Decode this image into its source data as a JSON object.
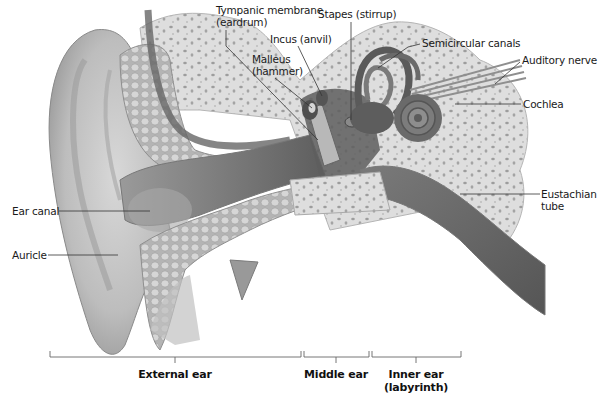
{
  "diagram": {
    "colors": {
      "background": "#ffffff",
      "bone": "#dcdcdc",
      "bone_pores": "#9a9a9a",
      "tissue_light": "#c8c8c8",
      "tissue_mid": "#a9a9a9",
      "tissue_dark": "#6e6e6e",
      "canal_dark": "#5a5a5a",
      "leader_line": "#333333",
      "text": "#1a1a1a"
    },
    "labels": [
      {
        "id": "tympanic-membrane",
        "lines": [
          "Tympanic membrane",
          "(eardrum)"
        ],
        "x": 216,
        "y": 4,
        "pointer": [
          [
            226,
            30
          ],
          [
            226,
            46
          ],
          [
            318,
            140
          ]
        ]
      },
      {
        "id": "stapes",
        "lines": [
          "Stapes (stirrup)"
        ],
        "x": 318,
        "y": 8,
        "pointer": [
          [
            351,
            22
          ],
          [
            351,
            120
          ]
        ]
      },
      {
        "id": "incus",
        "lines": [
          "Incus (anvil)"
        ],
        "x": 270,
        "y": 33,
        "pointer": [
          [
            298,
            46
          ],
          [
            322,
            96
          ]
        ]
      },
      {
        "id": "malleus",
        "lines": [
          "Malleus",
          "(hammer)"
        ],
        "x": 252,
        "y": 53,
        "pointer": [
          [
            275,
            78
          ],
          [
            312,
            108
          ]
        ]
      },
      {
        "id": "semicircular-canals",
        "lines": [
          "Semicircular canals"
        ],
        "x": 422,
        "y": 37,
        "pointer": [
          [
            420,
            44
          ],
          [
            408,
            47
          ],
          [
            378,
            68
          ]
        ]
      },
      {
        "id": "auditory-nerve",
        "lines": [
          "Auditory nerve"
        ],
        "x": 522,
        "y": 54,
        "pointer": [
          [
            520,
            62
          ],
          [
            495,
            84
          ]
        ]
      },
      {
        "id": "cochlea",
        "lines": [
          "Cochlea"
        ],
        "x": 523,
        "y": 98,
        "pointer": [
          [
            521,
            104
          ],
          [
            455,
            104
          ]
        ]
      },
      {
        "id": "eustachian-tube",
        "lines": [
          "Eustachian",
          "tube"
        ],
        "x": 541,
        "y": 188,
        "pointer": [
          [
            540,
            194
          ],
          [
            460,
            194
          ]
        ]
      },
      {
        "id": "ear-canal",
        "lines": [
          "Ear canal"
        ],
        "x": 12,
        "y": 205,
        "pointer": [
          [
            59,
            211
          ],
          [
            150,
            211
          ]
        ]
      },
      {
        "id": "auricle",
        "lines": [
          "Auricle"
        ],
        "x": 12,
        "y": 249,
        "pointer": [
          [
            48,
            255
          ],
          [
            118,
            255
          ]
        ]
      }
    ],
    "sections": [
      {
        "id": "external-ear",
        "lines": [
          "External ear"
        ],
        "x1": 50,
        "x2": 301,
        "tick": 175
      },
      {
        "id": "middle-ear",
        "lines": [
          "Middle ear"
        ],
        "x1": 304,
        "x2": 369,
        "tick": 336
      },
      {
        "id": "inner-ear",
        "lines": [
          "Inner ear",
          "(labyrinth)"
        ],
        "x1": 372,
        "x2": 461,
        "tick": 416
      }
    ],
    "bracket_y": 357
  }
}
